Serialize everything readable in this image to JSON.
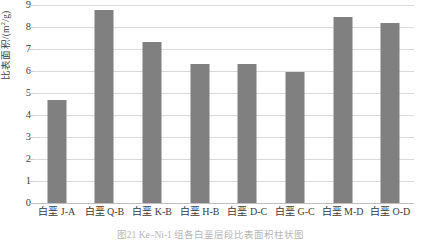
{
  "chart_data": {
    "type": "bar",
    "title": "",
    "xlabel": "",
    "ylabel": "比表面积/(m²/g)",
    "ylabel_parts": {
      "prefix": "比表面积/(m",
      "sup": "2",
      "suffix": "/g)"
    },
    "ylim": [
      0,
      9
    ],
    "yticks": [
      "0",
      "1",
      "2",
      "3",
      "4",
      "5",
      "6",
      "7",
      "8",
      "9"
    ],
    "grid": true,
    "legend": "none",
    "bar_color": "#808080",
    "grid_color": "#d9d9d9",
    "categories": [
      "白垩 J-A",
      "白垩 Q-B",
      "白垩 K-B",
      "白垩 H-B",
      "白垩 D-C",
      "白垩 G-C",
      "白垩 M-D",
      "白垩 O-D"
    ],
    "values": [
      4.68,
      8.77,
      7.3,
      6.3,
      6.3,
      5.97,
      8.45,
      8.2
    ]
  },
  "caption": {
    "text": "图21  Ke–Ni-1  组各白垩层段比表面积柱状图"
  }
}
